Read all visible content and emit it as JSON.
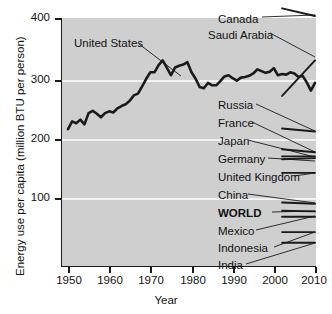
{
  "chart_data": {
    "type": "line",
    "title": "",
    "xlabel": "Year",
    "ylabel": "Energy use per capita (million BTU per person)",
    "xlim": [
      1949,
      2011
    ],
    "ylim": [
      0,
      415
    ],
    "xticks": [
      1950,
      1960,
      1970,
      1980,
      1990,
      2000,
      2010
    ],
    "xticklabels": [
      "1950",
      "1960",
      "1970",
      "1980",
      "1990",
      "2000",
      "2010"
    ],
    "yticks": [
      100,
      200,
      300,
      400
    ],
    "yticklabels": [
      "100",
      "200",
      "300",
      "400"
    ],
    "grid": "horizontal-white-gridlines",
    "legend_position": "inline-annotations-right",
    "plot_background": "#cfcfcf",
    "gridline_color": "#f2f2f2",
    "line_color": "#1a1a1a",
    "series": [
      {
        "name": "United States",
        "emphasis": "thick",
        "x": [
          1950,
          1951,
          1952,
          1953,
          1954,
          1955,
          1956,
          1957,
          1958,
          1959,
          1960,
          1961,
          1962,
          1963,
          1964,
          1965,
          1966,
          1967,
          1968,
          1969,
          1970,
          1971,
          1972,
          1973,
          1974,
          1975,
          1976,
          1977,
          1978,
          1979,
          1980,
          1981,
          1982,
          1983,
          1984,
          1985,
          1986,
          1987,
          1988,
          1989,
          1990,
          1991,
          1992,
          1993,
          1994,
          1995,
          1996,
          1997,
          1998,
          1999,
          2000,
          2001,
          2002,
          2003,
          2004,
          2005,
          2006,
          2007,
          2008,
          2009,
          2010
        ],
        "values": [
          214,
          227,
          224,
          230,
          222,
          241,
          245,
          240,
          234,
          241,
          244,
          242,
          249,
          253,
          256,
          262,
          271,
          274,
          286,
          299,
          310,
          310,
          322,
          330,
          318,
          305,
          318,
          321,
          323,
          327,
          310,
          299,
          285,
          283,
          292,
          288,
          288,
          295,
          303,
          305,
          300,
          296,
          301,
          302,
          304,
          308,
          315,
          312,
          309,
          311,
          317,
          305,
          307,
          306,
          310,
          308,
          302,
          304,
          293,
          279,
          292
        ]
      },
      {
        "name": "Canada",
        "x": [
          2002,
          2010
        ],
        "values": [
          418,
          405
        ]
      },
      {
        "name": "Saudi Arabia",
        "x": [
          2002,
          2010
        ],
        "values": [
          270,
          330
        ]
      },
      {
        "name": "Russia",
        "x": [
          2002,
          2010
        ],
        "values": [
          215,
          210
        ]
      },
      {
        "name": "France",
        "x": [
          2002,
          2010
        ],
        "values": [
          180,
          175
        ]
      },
      {
        "name": "Japan",
        "x": [
          2002,
          2010
        ],
        "values": [
          168,
          168
        ]
      },
      {
        "name": "Germany",
        "x": [
          2002,
          2010
        ],
        "values": [
          163,
          165
        ]
      },
      {
        "name": "United Kingdom",
        "x": [
          2002,
          2010
        ],
        "values": [
          140,
          140
        ]
      },
      {
        "name": "China",
        "x": [
          2002,
          2010
        ],
        "values": [
          90,
          88
        ]
      },
      {
        "name": "WORLD",
        "emphasis": "bold-label",
        "x": [
          2002,
          2010
        ],
        "values": [
          76,
          75
        ]
      },
      {
        "name": "Mexico",
        "x": [
          2002,
          2010
        ],
        "values": [
          66,
          66
        ]
      },
      {
        "name": "Indonesia",
        "x": [
          2002,
          2010
        ],
        "values": [
          40,
          40
        ]
      },
      {
        "name": "India",
        "x": [
          2002,
          2010
        ],
        "values": [
          22,
          22
        ]
      }
    ],
    "annotations": [
      {
        "label": "United States",
        "bold": false
      },
      {
        "label": "Canada",
        "bold": false
      },
      {
        "label": "Saudi Arabia",
        "bold": false
      },
      {
        "label": "Russia",
        "bold": false
      },
      {
        "label": "France",
        "bold": false
      },
      {
        "label": "Japan",
        "bold": false
      },
      {
        "label": "Germany",
        "bold": false
      },
      {
        "label": "United Kingdom",
        "bold": false
      },
      {
        "label": "China",
        "bold": false
      },
      {
        "label": "WORLD",
        "bold": true
      },
      {
        "label": "Mexico",
        "bold": false
      },
      {
        "label": "Indonesia",
        "bold": false
      },
      {
        "label": "India",
        "bold": false
      }
    ]
  },
  "axes": {
    "y_title": "Energy use per capita (million BTU per person)",
    "x_title": "Year",
    "y_tick_labels": [
      "400",
      "300",
      "200",
      "100"
    ],
    "x_tick_labels": [
      "1950",
      "1960",
      "1970",
      "1980",
      "1990",
      "2000",
      "2010"
    ]
  },
  "labels": {
    "united_states": "United States",
    "canada": "Canada",
    "saudi_arabia": "Saudi Arabia",
    "russia": "Russia",
    "france": "France",
    "japan": "Japan",
    "germany": "Germany",
    "united_kingdom": "United Kingdom",
    "china": "China",
    "world": "WORLD",
    "mexico": "Mexico",
    "indonesia": "Indonesia",
    "india": "India"
  }
}
